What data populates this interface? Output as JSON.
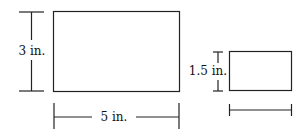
{
  "diagram": {
    "large_rectangle": {
      "height_label": "3 in.",
      "width_label": "5 in."
    },
    "small_rectangle": {
      "height_label": "1.5 in.",
      "width_label": ""
    }
  },
  "colors": {
    "stroke": "#222222",
    "background": "#ffffff"
  }
}
